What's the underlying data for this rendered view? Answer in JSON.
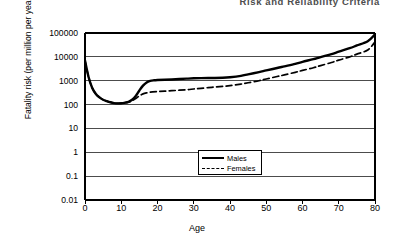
{
  "page": {
    "header": "Risk and Reliability Criteria"
  },
  "chart_data": {
    "type": "line",
    "title": "",
    "xlabel": "Age",
    "ylabel": "Fatality risk (per million per year)",
    "yscale": "log",
    "xscale": "linear",
    "xlim": [
      0,
      80
    ],
    "ylim": [
      0.01,
      100000
    ],
    "grid": true,
    "grid_axis": "y",
    "legend_position": "inside-lower-center",
    "xticks": [
      "0",
      "10",
      "20",
      "30",
      "40",
      "50",
      "60",
      "70",
      "80"
    ],
    "xtick_values": [
      0,
      10,
      20,
      30,
      40,
      50,
      60,
      70,
      80
    ],
    "yticks": [
      "100000",
      "10000",
      "1000",
      "100",
      "10",
      "1",
      "0.1",
      "0.01"
    ],
    "ytick_values": [
      100000,
      10000,
      1000,
      100,
      10,
      1,
      0.1,
      0.01
    ],
    "series": [
      {
        "name": "Males",
        "style": "solid",
        "color": "#000000",
        "width": 2.4,
        "x": [
          0,
          1,
          2,
          3,
          4,
          5,
          6,
          7,
          8,
          9,
          10,
          11,
          12,
          13,
          14,
          15,
          16,
          17,
          18,
          19,
          20,
          22,
          25,
          28,
          30,
          32,
          35,
          38,
          40,
          43,
          45,
          48,
          50,
          53,
          55,
          58,
          60,
          63,
          65,
          68,
          70,
          73,
          75,
          78,
          80
        ],
        "y": [
          7000,
          1400,
          500,
          280,
          200,
          160,
          140,
          125,
          115,
          112,
          113,
          120,
          130,
          160,
          230,
          390,
          620,
          850,
          980,
          1040,
          1070,
          1100,
          1150,
          1220,
          1260,
          1280,
          1300,
          1330,
          1400,
          1600,
          1850,
          2300,
          2700,
          3400,
          4000,
          5100,
          6200,
          8000,
          9800,
          13000,
          16500,
          23000,
          30000,
          45000,
          88000
        ]
      },
      {
        "name": "Females",
        "style": "dashed",
        "color": "#000000",
        "width": 1.7,
        "x": [
          0,
          1,
          2,
          3,
          4,
          5,
          6,
          7,
          8,
          9,
          10,
          11,
          12,
          13,
          14,
          15,
          16,
          17,
          18,
          20,
          22,
          25,
          28,
          30,
          32,
          35,
          38,
          40,
          43,
          45,
          48,
          50,
          53,
          55,
          58,
          60,
          63,
          65,
          68,
          70,
          73,
          75,
          78,
          80
        ],
        "y": [
          7000,
          1400,
          500,
          280,
          200,
          160,
          140,
          125,
          115,
          112,
          113,
          118,
          126,
          145,
          180,
          230,
          280,
          310,
          330,
          350,
          365,
          390,
          420,
          450,
          480,
          530,
          580,
          620,
          720,
          820,
          1000,
          1180,
          1500,
          1750,
          2250,
          2700,
          3500,
          4300,
          5800,
          7300,
          10000,
          13000,
          19500,
          42000
        ]
      }
    ]
  },
  "legend": {
    "items": [
      {
        "label": "Males",
        "style": "solid"
      },
      {
        "label": "Females",
        "style": "dashed"
      }
    ]
  }
}
